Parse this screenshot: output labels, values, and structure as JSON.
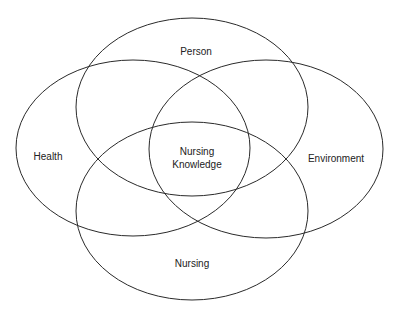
{
  "diagram": {
    "type": "venn",
    "stroke_color": "#2a2a2a",
    "background": "#ffffff",
    "sets": [
      {
        "id": "person",
        "label": "Person",
        "cx": 192,
        "cy": 107,
        "rx": 116,
        "ry": 89,
        "label_x": 196,
        "label_y": 55
      },
      {
        "id": "health",
        "label": "Health",
        "cx": 133,
        "cy": 148,
        "rx": 117,
        "ry": 88,
        "label_x": 48,
        "label_y": 160
      },
      {
        "id": "environment",
        "label": "Environment",
        "cx": 266,
        "cy": 149,
        "rx": 117,
        "ry": 89,
        "label_x": 336,
        "label_y": 162
      },
      {
        "id": "nursing",
        "label": "Nursing",
        "cx": 192,
        "cy": 211,
        "rx": 116,
        "ry": 89,
        "label_x": 192,
        "label_y": 267
      }
    ],
    "center": {
      "line1": "Nursing",
      "line2": "Knowledge",
      "x": 197,
      "y1": 155,
      "y2": 168
    }
  }
}
